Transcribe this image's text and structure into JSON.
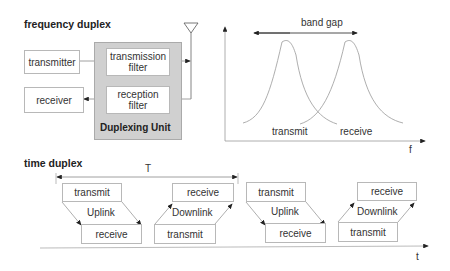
{
  "frequency_duplex": {
    "title": "frequency duplex",
    "blocks": {
      "transmitter": "transmitter",
      "receiver": "receiver",
      "transmission_filter": "transmission filter",
      "reception_filter": "reception filter",
      "duplexing_unit": "Duplexing Unit"
    },
    "spectrum": {
      "band_gap_label": "band gap",
      "transmit_label": "transmit",
      "receive_label": "receive",
      "axis_label": "f"
    }
  },
  "time_duplex": {
    "title": "time duplex",
    "period_label": "T",
    "axis_label": "t",
    "frames": [
      {
        "top": "transmit",
        "middle": "Uplink",
        "bottom": "receive"
      },
      {
        "top": "receive",
        "middle": "Downlink",
        "bottom": "transmit"
      },
      {
        "top": "transmit",
        "middle": "Uplink",
        "bottom": "receive"
      },
      {
        "top": "receive",
        "middle": "Downlink",
        "bottom": "transmit"
      }
    ]
  }
}
